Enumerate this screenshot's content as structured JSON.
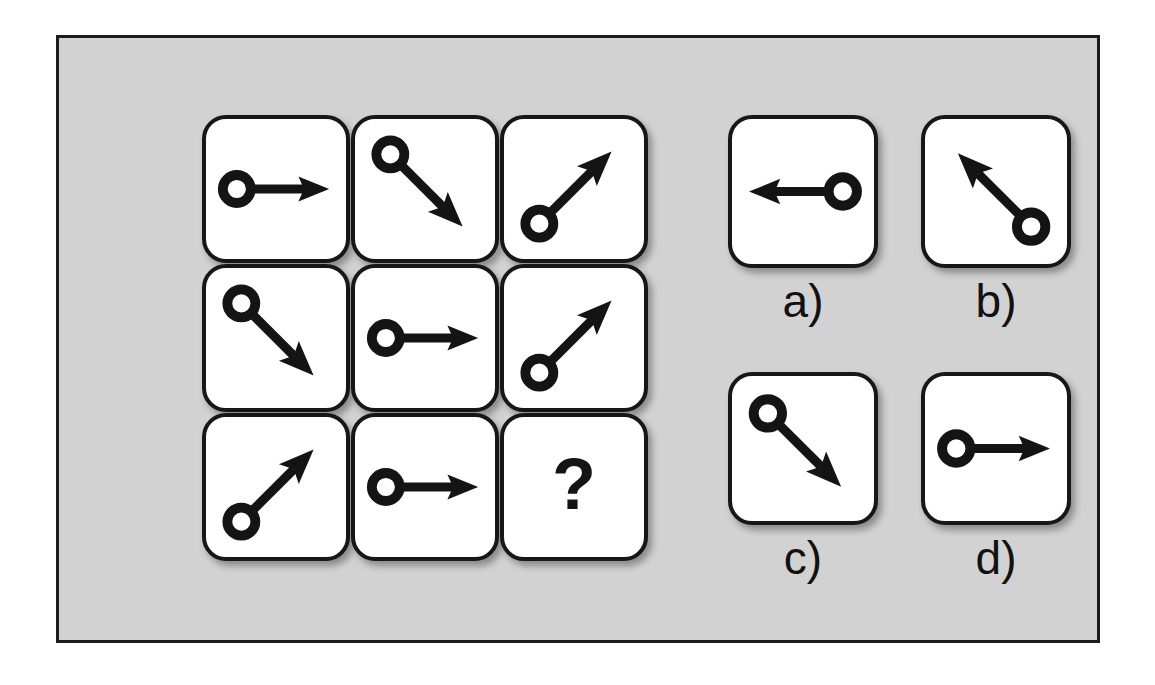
{
  "figure": {
    "kind": "matrix-reasoning-puzzle",
    "background_color": "#d2d2d2",
    "frame_border_color": "#1c1c1c",
    "tile_fill_color": "#ffffff",
    "tile_stroke_color": "#171717",
    "glyph_color": "#141414"
  },
  "matrix": {
    "rows": 3,
    "columns": 3,
    "cells": [
      {
        "id": "cell-r1c1",
        "glyph": "arrow-with-circle",
        "direction": "right",
        "angle_deg": 0,
        "circle_end": "tail",
        "label": ""
      },
      {
        "id": "cell-r1c2",
        "glyph": "arrow-with-circle",
        "direction": "down-right",
        "angle_deg": 45,
        "circle_end": "tail",
        "label": ""
      },
      {
        "id": "cell-r1c3",
        "glyph": "arrow-with-circle",
        "direction": "up-right",
        "angle_deg": -45,
        "circle_end": "tail",
        "label": ""
      },
      {
        "id": "cell-r2c1",
        "glyph": "arrow-with-circle",
        "direction": "down-right",
        "angle_deg": 45,
        "circle_end": "tail",
        "label": ""
      },
      {
        "id": "cell-r2c2",
        "glyph": "arrow-with-circle",
        "direction": "right",
        "angle_deg": 0,
        "circle_end": "tail",
        "label": ""
      },
      {
        "id": "cell-r2c3",
        "glyph": "arrow-with-circle",
        "direction": "up-right",
        "angle_deg": -45,
        "circle_end": "tail",
        "label": ""
      },
      {
        "id": "cell-r3c1",
        "glyph": "arrow-with-circle",
        "direction": "up-right",
        "angle_deg": -45,
        "circle_end": "tail",
        "label": ""
      },
      {
        "id": "cell-r3c2",
        "glyph": "arrow-with-circle",
        "direction": "right",
        "angle_deg": 0,
        "circle_end": "tail",
        "label": ""
      },
      {
        "id": "cell-r3c3",
        "glyph": "question-mark",
        "direction": "",
        "angle_deg": 0,
        "circle_end": "",
        "label": "?"
      }
    ]
  },
  "options": [
    {
      "id": "option-a",
      "label": "a)",
      "glyph": "arrow-with-circle",
      "direction": "left",
      "angle_deg": 180,
      "circle_end": "tail"
    },
    {
      "id": "option-b",
      "label": "b)",
      "glyph": "arrow-with-circle",
      "direction": "up-left",
      "angle_deg": -135,
      "circle_end": "tail"
    },
    {
      "id": "option-c",
      "label": "c)",
      "glyph": "arrow-with-circle",
      "direction": "down-right",
      "angle_deg": 45,
      "circle_end": "tail"
    },
    {
      "id": "option-d",
      "label": "d)",
      "glyph": "arrow-with-circle",
      "direction": "right",
      "angle_deg": 0,
      "circle_end": "tail"
    }
  ]
}
